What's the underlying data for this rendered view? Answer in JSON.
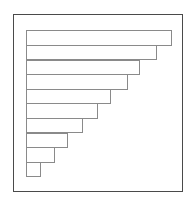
{
  "figure": {
    "frame": {
      "x": 13,
      "y": 14,
      "width": 170,
      "height": 178,
      "border_color": "#4a4a4a"
    },
    "bar_color": "#ffffff",
    "bar_border_color": "#8a8a8a",
    "background_color": "#ffffff"
  },
  "chart_data": {
    "type": "bar",
    "orientation": "horizontal",
    "title": "",
    "subtitle": "",
    "xlabel": "",
    "ylabel": "",
    "grid": false,
    "legend": null,
    "axis_visible": false,
    "tick_labels_visible": false,
    "data_labels_visible": false,
    "categories": [
      "1",
      "2",
      "3",
      "4",
      "5",
      "6",
      "7",
      "8",
      "9",
      "10"
    ],
    "values": [
      146.5,
      131.0,
      114.5,
      102.0,
      85.5,
      72.5,
      57.0,
      42.0,
      29.5,
      15.5
    ],
    "values_normalized": [
      100,
      89,
      78,
      70,
      58,
      49,
      39,
      29,
      20,
      11
    ],
    "xlim": [
      0,
      157
    ],
    "bar_left_px": 25.5,
    "bar_row_height_px": 14.6,
    "bar_first_top_px": 30.3,
    "bar_right_edges_px": [
      172.0,
      156.5,
      140.0,
      127.5,
      111.0,
      98.0,
      82.5,
      67.5,
      55.0,
      41.0
    ],
    "annotations": []
  }
}
